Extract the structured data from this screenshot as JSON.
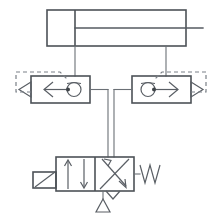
{
  "diagram": {
    "kind": "fluid-power-circuit",
    "background_color": "#ffffff",
    "line_color": "#555a60",
    "dashed_pilot_color": "#7b8087",
    "canvas": {
      "width": 222,
      "height": 217
    }
  },
  "components": {
    "cylinder": {
      "name": "double-acting-cylinder",
      "label": "",
      "barrel": {
        "x": 47,
        "y": 10,
        "width": 139,
        "height": 36
      },
      "piston_x": 75,
      "rod": {
        "from_x": 186,
        "to_x": 203,
        "y": 28
      },
      "ports": [
        {
          "name": "cap-end-port",
          "x": 75,
          "y": 46
        },
        {
          "name": "rod-end-port",
          "x": 166,
          "y": 46
        }
      ]
    },
    "left_valve": {
      "name": "pilot-operated-check-valve-left",
      "label": "",
      "box": {
        "x": 31,
        "y": 76,
        "width": 59,
        "height": 27
      },
      "arrow_direction": "left",
      "check_ball_cx": 74,
      "pilot_dashed": true,
      "port_in_side": "right",
      "port_out_side": "left"
    },
    "right_valve": {
      "name": "pilot-operated-check-valve-right",
      "label": "",
      "box": {
        "x": 132,
        "y": 76,
        "width": 59,
        "height": 27
      },
      "arrow_direction": "right",
      "check_ball_cx": 148,
      "pilot_dashed": true,
      "port_in_side": "left",
      "port_out_side": "right"
    },
    "directional_valve": {
      "name": "directional-control-valve-4-2",
      "label": "",
      "designation": "4/2",
      "box": {
        "x": 56,
        "y": 157,
        "width": 78,
        "height": 34
      },
      "positions": [
        {
          "name": "position-parallel",
          "symbol": "two-parallel-arrows"
        },
        {
          "name": "position-crossed",
          "symbol": "crossed-arrows"
        }
      ],
      "actuator_left": {
        "name": "manual-lever-actuator",
        "x": 33,
        "y": 172,
        "width": 23,
        "height": 16
      },
      "actuator_right": {
        "name": "spring-return",
        "coils": 3
      },
      "exhaust_port": {
        "name": "exhaust-to-atmosphere",
        "x": 103,
        "y": 197
      },
      "supply_port": {
        "name": "pressure-supply-port",
        "x": 112,
        "y": 191
      }
    },
    "connections": [
      {
        "name": "line-cylinder-cap-to-left-valve",
        "from": "cylinder.cap-end-port",
        "to": "left_valve.pilot-junction"
      },
      {
        "name": "line-cylinder-rod-to-right-valve",
        "from": "cylinder.rod-end-port",
        "to": "right_valve.pilot-junction"
      },
      {
        "name": "line-left-valve-to-dcv-port-b",
        "from": "left_valve.right-port",
        "to": "directional_valve.port-b"
      },
      {
        "name": "line-right-valve-to-dcv-port-a",
        "from": "right_valve.left-port",
        "to": "directional_valve.port-a"
      },
      {
        "name": "pilot-line-left",
        "type": "dashed"
      },
      {
        "name": "pilot-line-right",
        "type": "dashed"
      }
    ]
  }
}
